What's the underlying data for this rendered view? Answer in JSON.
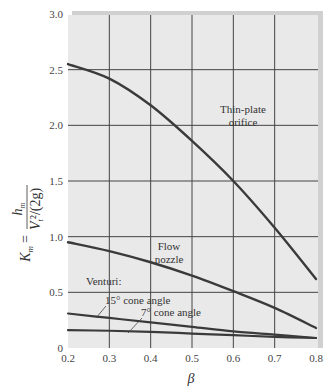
{
  "chart_data": {
    "type": "line",
    "title": "",
    "xlabel": "β",
    "ylabel": "K_m = h_m / (V_t²/(2g))",
    "ylabel_parts": {
      "lhs": "K",
      "lhs_sub": "m",
      "eq": "=",
      "num": "h",
      "num_sub": "m",
      "den": "V",
      "den_sub": "t",
      "den_rest": "²/(2g)"
    },
    "xlim": [
      0.2,
      0.8
    ],
    "ylim": [
      0,
      3.0
    ],
    "grid": true,
    "x_ticks": [
      "0.2",
      "0.3",
      "0.4",
      "0.5",
      "0.6",
      "0.7",
      "0.8"
    ],
    "y_ticks": [
      "0",
      "0.5",
      "1.0",
      "1.5",
      "2.0",
      "2.5",
      "3.0"
    ],
    "x": [
      0.2,
      0.3,
      0.4,
      0.5,
      0.6,
      0.7,
      0.8
    ],
    "series": [
      {
        "name": "Thin-plate orifice",
        "values": [
          2.55,
          2.42,
          2.18,
          1.86,
          1.5,
          1.08,
          0.62
        ]
      },
      {
        "name": "Flow nozzle",
        "values": [
          0.95,
          0.87,
          0.77,
          0.65,
          0.51,
          0.36,
          0.18
        ]
      },
      {
        "name": "Venturi: 15° cone angle",
        "values": [
          0.31,
          0.27,
          0.23,
          0.19,
          0.15,
          0.12,
          0.09
        ]
      },
      {
        "name": "Venturi: 7° cone angle",
        "values": [
          0.16,
          0.155,
          0.145,
          0.13,
          0.115,
          0.1,
          0.09
        ]
      }
    ],
    "annotations": [
      {
        "text": "Thin-plate",
        "line2": "orifice"
      },
      {
        "text": "Flow",
        "line2": "nozzle"
      },
      {
        "text": "Venturi:"
      },
      {
        "text": "15° cone angle"
      },
      {
        "text": "7° cone angle"
      }
    ]
  }
}
